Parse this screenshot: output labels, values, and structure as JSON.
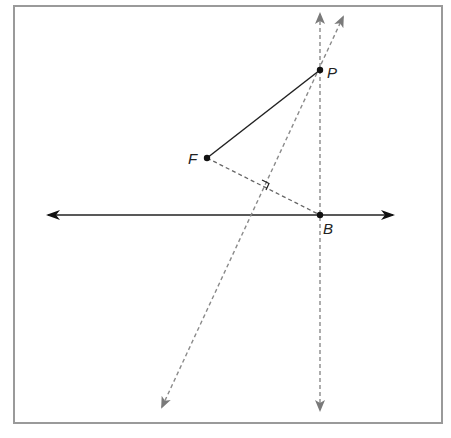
{
  "diagram": {
    "type": "geometry-construction",
    "points": {
      "P": {
        "label": "P",
        "x": 320,
        "y": 70
      },
      "F": {
        "label": "F",
        "x": 207,
        "y": 158
      },
      "B": {
        "label": "B",
        "x": 320,
        "y": 215
      }
    },
    "lines": {
      "directrix": {
        "style": "solid",
        "arrows": "both",
        "color": "#222222"
      },
      "vertical_through_B": {
        "style": "dashed",
        "arrows": "both",
        "color": "#8a8a8a"
      },
      "perpendicular_bisector": {
        "style": "dashed",
        "arrows": "both",
        "color": "#8a8a8a"
      },
      "segment_FB": {
        "style": "dashed",
        "color": "#666666"
      },
      "segment_FP": {
        "style": "solid",
        "color": "#222222"
      }
    },
    "marks": [
      "right-angle-mark"
    ],
    "colors": {
      "frame": "#9a9a9a",
      "solid": "#222222",
      "dashed": "#8a8a8a"
    }
  }
}
